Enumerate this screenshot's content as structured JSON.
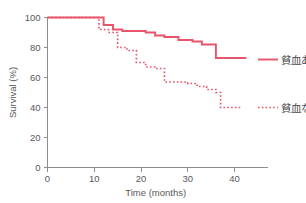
{
  "chart_data": {
    "type": "line",
    "title": "",
    "xlabel": "Time (months)",
    "ylabel": "Survival (%)",
    "xlim": [
      0,
      45
    ],
    "ylim": [
      0,
      100
    ],
    "xticks": [
      0,
      10,
      20,
      30,
      40
    ],
    "xtick_labels": [
      "0",
      "10",
      "20",
      "30",
      "40"
    ],
    "yticks": [
      0,
      20,
      40,
      60,
      80,
      100
    ],
    "ytick_labels": [
      "0",
      "20",
      "40",
      "60",
      "80",
      "100"
    ],
    "grid": false,
    "legend_position": "right",
    "accent_color": "#e8546b",
    "axis_color": "#8d8d8f",
    "text_color": "#58585a",
    "series": [
      {
        "name": "貧血あり",
        "style": "solid",
        "color": "#e8546b",
        "legend_label": "貧血あり",
        "x": [
          0,
          12,
          12,
          14,
          14,
          16,
          16,
          21,
          21,
          23,
          23,
          25,
          25,
          28,
          28,
          31,
          31,
          33,
          33,
          36,
          36,
          41,
          41,
          42.5
        ],
        "y": [
          100,
          100,
          95,
          95,
          92,
          92,
          91,
          91,
          90,
          90,
          88,
          88,
          87,
          87,
          85,
          85,
          84,
          84,
          82,
          82,
          73,
          73,
          73,
          73
        ]
      },
      {
        "name": "貧血なし",
        "style": "dotted",
        "color": "#e8546b",
        "legend_label": "貧血なし",
        "x": [
          0,
          11,
          11,
          13,
          13,
          15,
          15,
          17,
          17,
          19,
          19,
          21,
          21,
          23,
          23,
          25,
          25,
          30,
          30,
          32,
          32,
          34,
          34,
          36,
          36,
          37,
          37,
          41.5
        ],
        "y": [
          100,
          100,
          92,
          92,
          90,
          90,
          80,
          80,
          78,
          78,
          70,
          70,
          67,
          67,
          66,
          66,
          57,
          57,
          56,
          56,
          54,
          54,
          52,
          52,
          50,
          50,
          40,
          40
        ]
      }
    ]
  },
  "legend": {
    "entries": [
      {
        "label": "貧血あり",
        "style": "solid"
      },
      {
        "label": "貧血なし",
        "style": "dotted"
      }
    ]
  }
}
